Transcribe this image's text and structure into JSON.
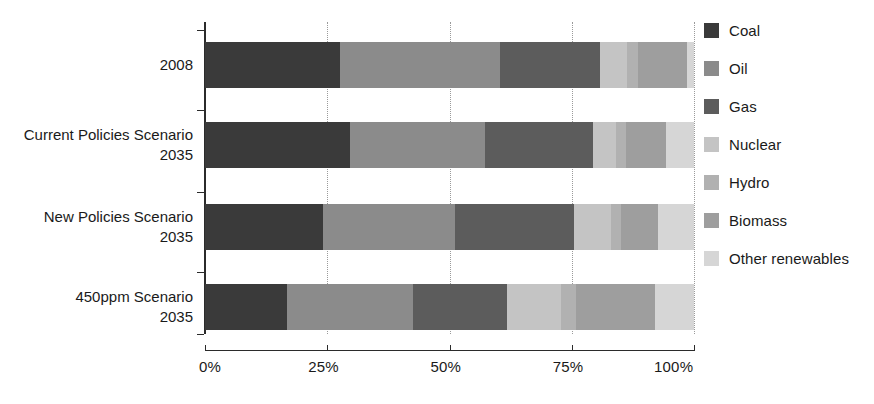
{
  "chart_data": {
    "type": "bar",
    "orientation": "horizontal",
    "stacked": true,
    "normalized": true,
    "title": "",
    "subtitle": "",
    "xlabel": "",
    "ylabel": "",
    "xlim": [
      0,
      100
    ],
    "xticks": [
      0,
      25,
      50,
      75,
      100
    ],
    "xtick_labels": [
      "0%",
      "25%",
      "50%",
      "75%",
      "100%"
    ],
    "grid": "vertical-dotted",
    "legend_position": "right",
    "categories": [
      "2008",
      "Current Policies Scenario 2035",
      "New Policies Scenario 2035",
      "450ppm Scenario 2035"
    ],
    "category_lines": [
      [
        "",
        "2008"
      ],
      [
        "Current Policies Scenario",
        "2035"
      ],
      [
        "New Policies Scenario",
        "2035"
      ],
      [
        "450ppm Scenario",
        "2035"
      ]
    ],
    "series": [
      {
        "name": "Coal",
        "color": "#3a3a3a",
        "values": [
          27.6,
          29.7,
          24.1,
          16.8
        ]
      },
      {
        "name": "Oil",
        "color": "#8b8b8b",
        "values": [
          32.7,
          27.6,
          27.0,
          25.8
        ]
      },
      {
        "name": "Gas",
        "color": "#5c5c5c",
        "values": [
          20.4,
          22.1,
          24.3,
          19.2
        ]
      },
      {
        "name": "Nuclear",
        "color": "#c4c4c4",
        "values": [
          5.7,
          4.7,
          7.6,
          11.0
        ]
      },
      {
        "name": "Hydro",
        "color": "#b1b1b1",
        "values": [
          2.2,
          2.0,
          2.0,
          3.0
        ]
      },
      {
        "name": "Biomass",
        "color": "#9e9e9e",
        "values": [
          10.0,
          8.2,
          7.6,
          16.2
        ]
      },
      {
        "name": "Other renewables",
        "color": "#d6d6d6",
        "values": [
          1.4,
          5.7,
          7.4,
          8.0
        ]
      }
    ]
  },
  "legend": {
    "items": [
      {
        "label": "Coal",
        "color": "#3a3a3a"
      },
      {
        "label": "Oil",
        "color": "#8b8b8b"
      },
      {
        "label": "Gas",
        "color": "#5c5c5c"
      },
      {
        "label": "Nuclear",
        "color": "#c4c4c4"
      },
      {
        "label": "Hydro",
        "color": "#b1b1b1"
      },
      {
        "label": "Biomass",
        "color": "#9e9e9e"
      },
      {
        "label": "Other renewables",
        "color": "#d6d6d6"
      }
    ]
  },
  "axes": {
    "x_tick_labels": [
      "0%",
      "25%",
      "50%",
      "75%",
      "100%"
    ],
    "y_category_labels": [
      {
        "line1": "",
        "line2": "2008"
      },
      {
        "line1": "Current Policies Scenario",
        "line2": "2035"
      },
      {
        "line1": "New Policies Scenario",
        "line2": "2035"
      },
      {
        "line1": "450ppm Scenario",
        "line2": "2035"
      }
    ]
  }
}
